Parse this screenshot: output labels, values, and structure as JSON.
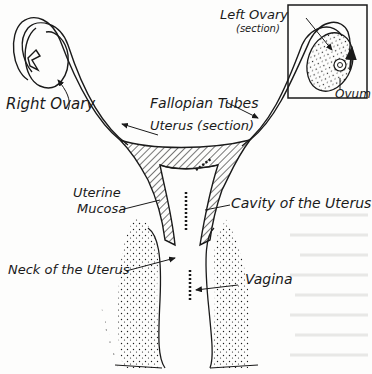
{
  "diagram": {
    "labels": {
      "right_ovary": "Right Ovary",
      "left_ovary": "Left Ovary",
      "left_ovary_sub": "(section)",
      "ovum": "Ovum",
      "fallopian_tubes": "Fallopian Tubes",
      "uterus_section": "Uterus (section)",
      "uterine_mucosa_1": "Uterine",
      "uterine_mucosa_2": "Mucosa",
      "cavity_of_uterus": "Cavity of the Uterus",
      "neck_of_uterus": "Neck of the Uterus",
      "vagina": "Vagina"
    },
    "inset": {
      "title": "Left Ovary (section) inset box"
    },
    "colors": {
      "ink": "#1a1a1a",
      "paper": "#fdfdfc",
      "ghost_text": "#e6e6e4"
    }
  }
}
